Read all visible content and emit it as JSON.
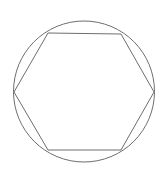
{
  "figure": {
    "background_color": "#ffffff",
    "canvas": {
      "width": 168,
      "height": 183
    },
    "stroke_color": "#6e6e6e",
    "stroke_width": 1,
    "shapes": {
      "circle": {
        "name": "circumscribed-circle",
        "center_x": 84,
        "center_y": 91.5,
        "radius": 70.5
      },
      "hexagon": {
        "name": "inscribed-hexagon",
        "sides": 6,
        "points": "14,92 48,33 121,34 154,92 121,150 48,150",
        "vertices": [
          {
            "label": "left",
            "x": 14,
            "y": 92
          },
          {
            "label": "top-left",
            "x": 48,
            "y": 33
          },
          {
            "label": "top-right",
            "x": 121,
            "y": 34
          },
          {
            "label": "right",
            "x": 154,
            "y": 92
          },
          {
            "label": "bottom-right",
            "x": 121,
            "y": 150
          },
          {
            "label": "bottom-left",
            "x": 48,
            "y": 150
          }
        ]
      }
    }
  }
}
